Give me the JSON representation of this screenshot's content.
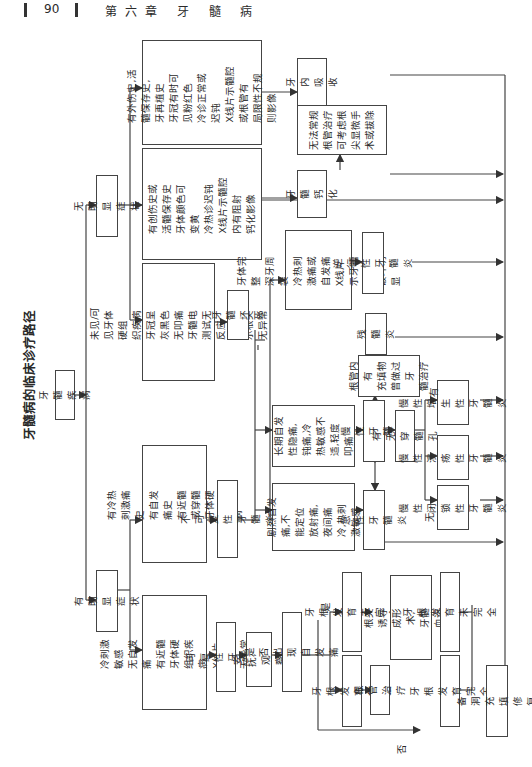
{
  "header": {
    "page_number": "90",
    "chapter": "第六章  牙 髓 病"
  },
  "diagram": {
    "title": "牙髓病的临床诊疗路径",
    "nodes": {
      "root": "牙髓疾病",
      "obvious": "有明显症状",
      "no_obvious": "无明显症状",
      "sym_reversible": "冷刺激敏感\n无自发痛\n有近髓牙体硬组织疾病\nX线片示根尖无异常",
      "sym_irreversible": "有冷热刺激痛史\n有自发痛史\n有近髓或穿髓牙体硬组织疾病",
      "reversible": "可复性牙髓炎",
      "irreversible": "不可复性牙髓炎",
      "soothe": "安抚,观察",
      "spont_pain_q": "是否出现自发痛",
      "acute_sym": "剧烈自发痛,不\n能定位\n放射痛,夜间痛\n冷,热刺激敏感",
      "chronic_sym": "长期自发性隐痛,钝痛,冷\n热敏感不适,轻度叩痛",
      "acute": "急性牙髓炎",
      "chronic": "慢性牙髓炎",
      "perforation_q": "有无穿髓孔",
      "closed": "慢性闭锁\n性牙髓炎",
      "ulcer": "慢性溃疡\n性牙髓炎",
      "hyper": "慢性增生\n性牙髓炎",
      "canal_filled": "根管内有\n充填物\n曾做过牙\n髓治疗",
      "residual": "残髓炎",
      "retro_sym": "牙体完整\n深牙周袋\n冷热刺激痛或自发痛\nX线片示牙槽骨吸收\n破坏明显",
      "retrograde": "逆行性牙髓炎",
      "necrosis_sym": "未见/可见牙体硬组\n织疾病\n牙冠呈灰黑色\n无叩痛\n牙髓电测试无反应\nX线片示根尖无异常",
      "necrosis": "牙髓坏死",
      "calc_sym": "有创伤史或活髓保存史\n牙体颜色可变黄\n冷热诊迟钝\nX线片示髓腔内有阻射\n钙化影像",
      "calcification": "牙髓\n钙化",
      "resorp_sym": "有外伤史,活髓保存史,\n牙再植史\n牙冠有时可见粉红色\n冷诊正常或迟钝\nX线片示髓腔或根管有\n局限性不规则影像",
      "resorption": "牙内\n吸收",
      "no_conventional": "无法常规\n根管治疗\n可考虑根\n尖显微手\n术或拔除",
      "root_incomplete_1": "牙根发育未完全",
      "root_complete_1": "牙根发育完全",
      "root_canal": "根管治疗",
      "apexogenesis": "根尖诱导成形术,\n牙髓血运重建",
      "root_incomplete_2": "牙根发育未完全",
      "root_complete_2": "牙根发育完全",
      "restoration": "备洞充填修复"
    },
    "edge_labels": {
      "yes": "是",
      "no": "否",
      "has": "有",
      "none": "无"
    }
  },
  "colors": {
    "line": "#444444",
    "text": "#2a2a2a",
    "background": "#ffffff"
  }
}
